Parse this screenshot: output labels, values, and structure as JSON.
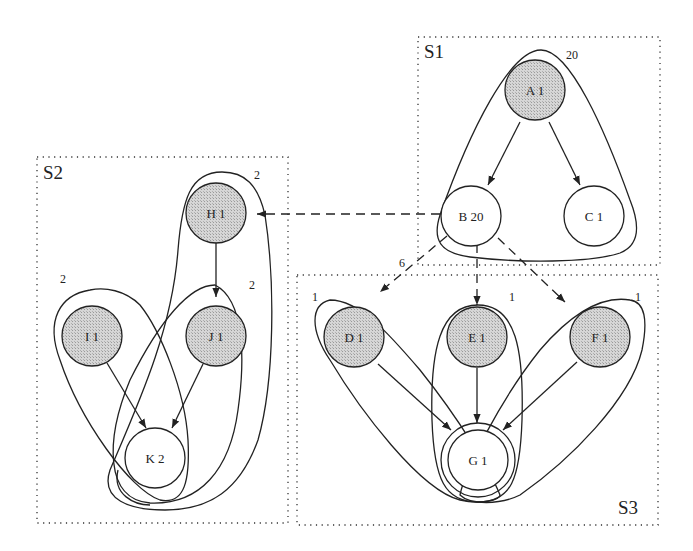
{
  "colors": {
    "shaded_fill": "#d0d0d0",
    "plain_fill": "#ffffff",
    "stroke": "#222222"
  },
  "subsystems": [
    {
      "id": "S1",
      "label": "S1"
    },
    {
      "id": "S2",
      "label": "S2"
    },
    {
      "id": "S3",
      "label": "S3"
    }
  ],
  "nodes": [
    {
      "id": "A",
      "label": "A 1",
      "shaded": true,
      "subsystem": "S1"
    },
    {
      "id": "B",
      "label": "B 20",
      "shaded": false,
      "subsystem": "S1"
    },
    {
      "id": "C",
      "label": "C 1",
      "shaded": false,
      "subsystem": "S1"
    },
    {
      "id": "H",
      "label": "H 1",
      "shaded": true,
      "subsystem": "S2"
    },
    {
      "id": "I",
      "label": "I 1",
      "shaded": true,
      "subsystem": "S2"
    },
    {
      "id": "J",
      "label": "J 1",
      "shaded": true,
      "subsystem": "S2"
    },
    {
      "id": "K",
      "label": "K 2",
      "shaded": false,
      "subsystem": "S2"
    },
    {
      "id": "D",
      "label": "D 1",
      "shaded": true,
      "subsystem": "S3"
    },
    {
      "id": "E",
      "label": "E 1",
      "shaded": true,
      "subsystem": "S3"
    },
    {
      "id": "F",
      "label": "F 1",
      "shaded": true,
      "subsystem": "S3"
    },
    {
      "id": "G",
      "label": "G 1",
      "shaded": false,
      "subsystem": "S3"
    }
  ],
  "edges": [
    {
      "from": "A",
      "to": "B",
      "style": "solid"
    },
    {
      "from": "A",
      "to": "C",
      "style": "solid"
    },
    {
      "from": "B",
      "to": "H",
      "style": "dashed"
    },
    {
      "from": "B",
      "to": "D",
      "style": "dashed"
    },
    {
      "from": "B",
      "to": "E",
      "style": "dashed"
    },
    {
      "from": "B",
      "to": "F",
      "style": "dashed"
    },
    {
      "from": "H",
      "to": "J",
      "style": "solid"
    },
    {
      "from": "I",
      "to": "K",
      "style": "solid"
    },
    {
      "from": "J",
      "to": "K",
      "style": "solid"
    },
    {
      "from": "D",
      "to": "G",
      "style": "solid"
    },
    {
      "from": "E",
      "to": "G",
      "style": "solid"
    },
    {
      "from": "F",
      "to": "G",
      "style": "solid"
    }
  ],
  "enclosure_counts": {
    "A_group": "20",
    "H_group": "2",
    "I_group": "2",
    "J_group": "2",
    "B_to_S3": "6",
    "D_group": "1",
    "E_group": "1",
    "F_group": "1"
  }
}
